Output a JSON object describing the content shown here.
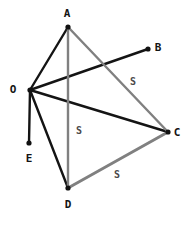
{
  "figure": {
    "kind": "line-graph-diagram",
    "width": 184,
    "height": 225,
    "background_color": "#ffffff"
  },
  "colors": {
    "black_edge": "#141414",
    "gray_edge": "#808080",
    "node_dot": "#111111",
    "label_text": "#141414",
    "edge_label_text": "#4a4a4a"
  },
  "chart_data": {
    "type": "diagram",
    "title": "",
    "nodes": [
      {
        "id": "A",
        "label": "A",
        "x": 68,
        "y": 27,
        "label_x": 67,
        "label_y": 13
      },
      {
        "id": "B",
        "label": "B",
        "x": 148,
        "y": 49,
        "label_x": 158,
        "label_y": 47
      },
      {
        "id": "C",
        "label": "C",
        "x": 168,
        "y": 132,
        "label_x": 177,
        "label_y": 132
      },
      {
        "id": "D",
        "label": "D",
        "x": 68,
        "y": 188,
        "label_x": 68,
        "label_y": 204
      },
      {
        "id": "E",
        "label": "E",
        "x": 29,
        "y": 143,
        "label_x": 29,
        "label_y": 158
      },
      {
        "id": "O",
        "label": "O",
        "x": 30,
        "y": 90,
        "label_x": 13,
        "label_y": 89
      }
    ],
    "edges": [
      {
        "from": "O",
        "to": "A",
        "color": "black",
        "width": 2.4
      },
      {
        "from": "O",
        "to": "B",
        "color": "black",
        "width": 2.4
      },
      {
        "from": "O",
        "to": "C",
        "color": "black",
        "width": 2.4
      },
      {
        "from": "O",
        "to": "D",
        "color": "black",
        "width": 2.4
      },
      {
        "from": "O",
        "to": "E",
        "color": "black",
        "width": 2.4
      },
      {
        "from": "A",
        "to": "D",
        "color": "gray",
        "width": 2.4
      },
      {
        "from": "A",
        "to": "C",
        "color": "gray",
        "width": 2.4
      },
      {
        "from": "D",
        "to": "C",
        "color": "gray",
        "width": 3.0
      }
    ],
    "edge_labels": [
      {
        "text": "S",
        "edge": "A-C",
        "x": 133,
        "y": 82
      },
      {
        "text": "S",
        "edge": "A-D",
        "x": 79,
        "y": 131
      },
      {
        "text": "S",
        "edge": "D-C",
        "x": 117,
        "y": 175
      }
    ]
  }
}
